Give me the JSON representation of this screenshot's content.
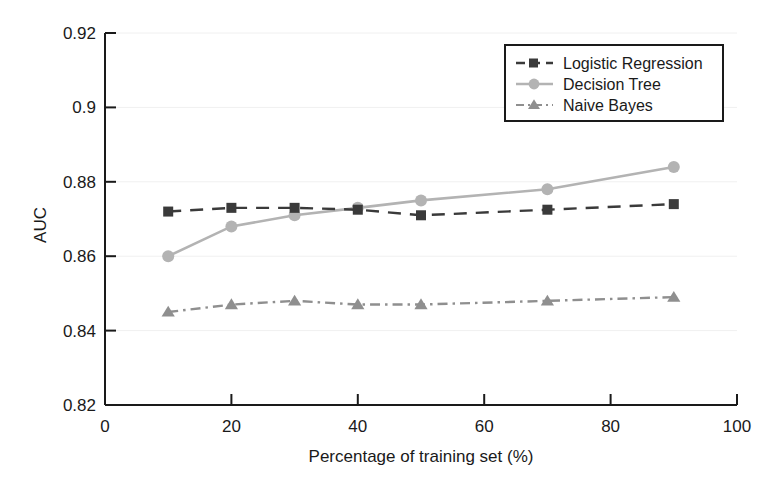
{
  "chart_data": {
    "type": "line",
    "title": "",
    "xlabel": "Percentage of training set (%)",
    "ylabel": "AUC",
    "x": [
      10,
      20,
      30,
      40,
      50,
      70,
      90
    ],
    "xlim": [
      0,
      100
    ],
    "ylim": [
      0.82,
      0.92
    ],
    "xticks": [
      "0",
      "20",
      "40",
      "60",
      "80",
      "100"
    ],
    "xtick_values": [
      0,
      20,
      40,
      60,
      80,
      100
    ],
    "yticks": [
      "0.82",
      "0.84",
      "0.86",
      "0.88",
      "0.9",
      "0.92"
    ],
    "ytick_values": [
      0.82,
      0.84,
      0.86,
      0.88,
      0.9,
      0.92
    ],
    "grid": true,
    "legend_position": "top-right",
    "series": [
      {
        "name": "Logistic Regression",
        "values": [
          0.872,
          0.873,
          0.873,
          0.8725,
          0.871,
          0.8725,
          0.874
        ],
        "color": "#3a3a3a",
        "marker": "square",
        "linestyle": "dashed"
      },
      {
        "name": "Decision Tree",
        "values": [
          0.86,
          0.868,
          0.871,
          0.873,
          0.875,
          0.878,
          0.884
        ],
        "color": "#b3b3b3",
        "marker": "circle",
        "linestyle": "solid"
      },
      {
        "name": "Naive Bayes",
        "values": [
          0.845,
          0.847,
          0.848,
          0.847,
          0.847,
          0.848,
          0.849
        ],
        "color": "#8f8f8f",
        "marker": "triangle",
        "linestyle": "dashdot"
      }
    ]
  },
  "legend": {
    "items": [
      {
        "label": "Logistic Regression"
      },
      {
        "label": "Decision Tree"
      },
      {
        "label": "Naive Bayes"
      }
    ]
  },
  "axes": {
    "y_title": "AUC",
    "x_title": "Percentage of training set (%)",
    "y_labels": [
      "0.92",
      "0.9",
      "0.88",
      "0.86",
      "0.84",
      "0.82"
    ],
    "x_labels": [
      "0",
      "20",
      "40",
      "60",
      "80",
      "100"
    ]
  },
  "colors": {
    "axis": "#1a1a1a",
    "grid": "#f0f0f0",
    "background": "#ffffff",
    "logistic_regression": "#3a3a3a",
    "decision_tree": "#b3b3b3",
    "naive_bayes": "#8f8f8f"
  }
}
